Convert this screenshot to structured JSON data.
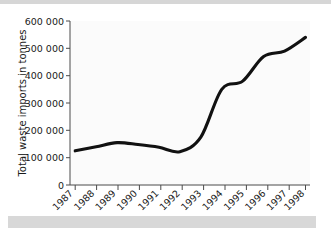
{
  "chart_data": {
    "type": "line",
    "title": "",
    "xlabel": "",
    "ylabel": "Total waste imports in tonnes",
    "categories": [
      "1987",
      "1988",
      "1989",
      "1990",
      "1991",
      "1992",
      "1993",
      "1994",
      "1995",
      "1996",
      "1997",
      "1998"
    ],
    "values": [
      125000,
      140000,
      155000,
      148000,
      138000,
      122000,
      175000,
      350000,
      380000,
      470000,
      490000,
      540000
    ],
    "series": [
      {
        "name": "Total waste imports",
        "values": [
          125000,
          140000,
          155000,
          148000,
          138000,
          122000,
          175000,
          350000,
          380000,
          470000,
          490000,
          540000
        ]
      }
    ],
    "ylim": [
      0,
      600000
    ],
    "ytick_values": [
      0,
      100000,
      200000,
      300000,
      400000,
      500000,
      600000
    ],
    "ytick_labels": [
      "0",
      "100 000",
      "200 000",
      "300 000",
      "400 000",
      "500 000",
      "600 000"
    ],
    "grid": false,
    "legend": false,
    "legend_position": "none",
    "line_color": "#111111",
    "axis_color": "#4a4a4a",
    "background_color": "#ffffff",
    "band_color": "#d8d8d8",
    "xtick_rotation": 45
  },
  "axes": {
    "y_title": "Total waste imports in tonnes"
  }
}
